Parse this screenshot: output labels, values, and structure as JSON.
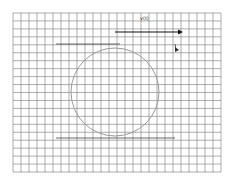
{
  "diagram": {
    "grid": {
      "x0": 13,
      "y0": 13,
      "x1": 221,
      "y1": 172,
      "cols": 26,
      "rows": 20,
      "color": "#777777"
    },
    "circle": {
      "cx": 115,
      "cy": 92,
      "r": 44,
      "color": "#9a9a9a"
    },
    "top_line": {
      "x1": 56,
      "x2": 120,
      "y": 44
    },
    "bottom_line": {
      "x1": 56,
      "x2": 175,
      "y": 138
    },
    "arrow": {
      "x1": 115,
      "x2": 183,
      "y": 32,
      "color": "#111111"
    },
    "arrow_label": "v(t)",
    "small_marker_label": "b"
  }
}
